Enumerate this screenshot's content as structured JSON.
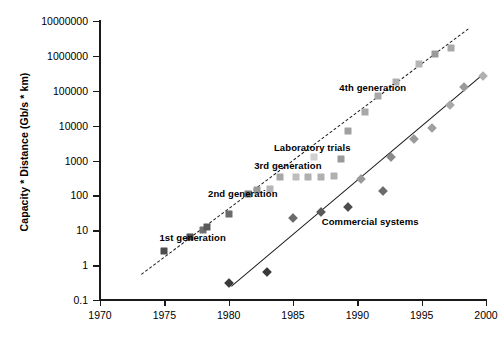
{
  "chart_data": {
    "type": "scatter",
    "title": "",
    "xlabel": "",
    "ylabel": "Capacity * Distance (Gb/s * km)",
    "xlim": [
      1970,
      2000
    ],
    "ylim": [
      0.1,
      10000000
    ],
    "yscale": "log",
    "xscale": "linear",
    "grid": false,
    "legend": false,
    "xticks": [
      "1970",
      "1975",
      "1980",
      "1985",
      "1990",
      "1995",
      "2000"
    ],
    "yticks": [
      "0.1",
      "1",
      "10",
      "100",
      "1000",
      "10000",
      "100000",
      "1000000",
      "10000000"
    ],
    "annotations": [
      {
        "text": "1st generation",
        "x": 1977.2,
        "y": 6.5
      },
      {
        "text": "2nd generation",
        "x": 1981.1,
        "y": 115
      },
      {
        "text": "3rd generation",
        "x": 1984.6,
        "y": 760
      },
      {
        "text": "Laboratory trials",
        "x": 1986.5,
        "y": 2400
      },
      {
        "text": "4th generation",
        "x": 1991.2,
        "y": 125000
      },
      {
        "text": "Commercial systems",
        "x": 1991.0,
        "y": 18
      }
    ],
    "series": [
      {
        "name": "Laboratory trials",
        "marker": "square",
        "color": "#6b6b6b",
        "points": [
          {
            "x": 1975.0,
            "y": 2.6,
            "color": "#4d4d4d"
          },
          {
            "x": 1977.0,
            "y": 6.2,
            "color": "#4d4d4d"
          },
          {
            "x": 1978.0,
            "y": 10.0,
            "color": "#707070"
          },
          {
            "x": 1978.3,
            "y": 12.0,
            "color": "#5a5a5a"
          },
          {
            "x": 1980.0,
            "y": 30.0,
            "color": "#6b6b6b"
          },
          {
            "x": 1981.5,
            "y": 110.0,
            "color": "#7a7a7a"
          },
          {
            "x": 1982.2,
            "y": 140.0,
            "color": "#9a9a9a"
          },
          {
            "x": 1983.2,
            "y": 150.0,
            "color": "#b5b5b5"
          },
          {
            "x": 1984.0,
            "y": 330.0,
            "color": "#a8a8a8"
          },
          {
            "x": 1985.2,
            "y": 340.0,
            "color": "#bdbdbd"
          },
          {
            "x": 1986.2,
            "y": 340.0,
            "color": "#b0b0b0"
          },
          {
            "x": 1987.2,
            "y": 340.0,
            "color": "#b0b0b0"
          },
          {
            "x": 1988.2,
            "y": 350.0,
            "color": "#b0b0b0"
          },
          {
            "x": 1986.6,
            "y": 1300.0,
            "color": "#d0d0d0"
          },
          {
            "x": 1988.7,
            "y": 1100.0,
            "color": "#9a9a9a"
          },
          {
            "x": 1989.3,
            "y": 7000.0,
            "color": "#a0a0a0"
          },
          {
            "x": 1990.6,
            "y": 25000.0,
            "color": "#a8a8a8"
          },
          {
            "x": 1991.6,
            "y": 70000.0,
            "color": "#a8a8a8"
          },
          {
            "x": 1993.0,
            "y": 180000.0,
            "color": "#b0b0b0"
          },
          {
            "x": 1994.8,
            "y": 600000.0,
            "color": "#b5b5b5"
          },
          {
            "x": 1996.0,
            "y": 1100000.0,
            "color": "#9a9a9a"
          },
          {
            "x": 1997.3,
            "y": 1700000.0,
            "color": "#a8a8a8"
          }
        ]
      },
      {
        "name": "Commercial systems",
        "marker": "diamond",
        "color": "#555555",
        "points": [
          {
            "x": 1980.0,
            "y": 0.3,
            "color": "#3a3a3a"
          },
          {
            "x": 1983.0,
            "y": 0.62,
            "color": "#3a3a3a"
          },
          {
            "x": 1985.0,
            "y": 22.0,
            "color": "#6b6b6b"
          },
          {
            "x": 1987.2,
            "y": 33.0,
            "color": "#5a5a5a"
          },
          {
            "x": 1989.3,
            "y": 45.0,
            "color": "#4d4d4d"
          },
          {
            "x": 1990.3,
            "y": 300.0,
            "color": "#9a9a9a"
          },
          {
            "x": 1992.0,
            "y": 130.0,
            "color": "#6b6b6b"
          },
          {
            "x": 1992.6,
            "y": 1300.0,
            "color": "#8a8a8a"
          },
          {
            "x": 1994.4,
            "y": 4200.0,
            "color": "#9a9a9a"
          },
          {
            "x": 1995.8,
            "y": 8500.0,
            "color": "#a0a0a0"
          },
          {
            "x": 1997.2,
            "y": 40000.0,
            "color": "#a8a8a8"
          },
          {
            "x": 1998.3,
            "y": 130000.0,
            "color": "#9a9a9a"
          },
          {
            "x": 1999.8,
            "y": 270000.0,
            "color": "#b0b0b0"
          }
        ]
      }
    ],
    "trendlines": [
      {
        "name": "laboratory-trend",
        "style": "dash-dot",
        "x0": 1973.2,
        "y0": 0.55,
        "x1": 1998.6,
        "y1": 6000000.0
      },
      {
        "name": "commercial-trend",
        "style": "solid",
        "x0": 1980.2,
        "y0": 0.25,
        "x1": 1999.9,
        "y1": 330000.0
      }
    ]
  }
}
